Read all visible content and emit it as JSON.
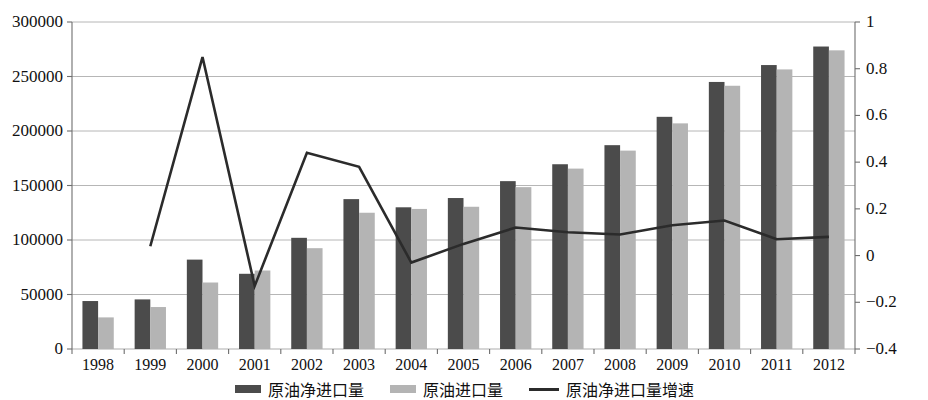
{
  "chart_data": {
    "type": "bar",
    "title": "",
    "subtitle": "",
    "xlabel": "",
    "ylabel": "",
    "y2label": "",
    "categories": [
      "1998",
      "1999",
      "2000",
      "2001",
      "2002",
      "2003",
      "2004",
      "2005",
      "2006",
      "2007",
      "2008",
      "2009",
      "2010",
      "2011",
      "2012"
    ],
    "ylim": [
      0,
      300000
    ],
    "y_ticks": [
      "0",
      "50000",
      "100000",
      "150000",
      "200000",
      "250000",
      "300000"
    ],
    "y_tick_values": [
      0,
      50000,
      100000,
      150000,
      200000,
      250000,
      300000
    ],
    "y2lim": [
      -0.4,
      1
    ],
    "y2_ticks": [
      "-0.4",
      "-0.2",
      "0",
      "0.2",
      "0.4",
      "0.6",
      "0.8",
      "1"
    ],
    "y2_tick_values": [
      -0.4,
      -0.2,
      0,
      0.2,
      0.4,
      0.6,
      0.8,
      1
    ],
    "grid": true,
    "legend_position": "bottom",
    "series": [
      {
        "name": "原油净进口量",
        "kind": "bar",
        "axis": "left",
        "color": "#4b4b4b",
        "values": [
          44000,
          45500,
          82000,
          69000,
          102000,
          137500,
          130000,
          138500,
          154000,
          169500,
          187000,
          213000,
          245000,
          260500,
          277500
        ]
      },
      {
        "name": "原油进口量",
        "kind": "bar",
        "axis": "left",
        "color": "#b4b4b4",
        "values": [
          29000,
          38500,
          61000,
          72000,
          92500,
          125000,
          128500,
          130500,
          148500,
          165500,
          182000,
          207000,
          241500,
          256500,
          274000
        ]
      },
      {
        "name": "原油净进口量增速",
        "kind": "line",
        "axis": "right",
        "color": "#2b2b2b",
        "values": [
          null,
          0.04,
          0.85,
          -0.13,
          0.44,
          0.38,
          -0.03,
          0.05,
          0.12,
          0.1,
          0.09,
          0.13,
          0.15,
          0.07,
          0.08
        ]
      }
    ]
  },
  "legend": {
    "items": [
      {
        "label": "原油净进口量",
        "swatch": "dark-bar-swatch",
        "color": "#4b4b4b",
        "type": "bar"
      },
      {
        "label": "原油进口量",
        "swatch": "light-bar-swatch",
        "color": "#b4b4b4",
        "type": "bar"
      },
      {
        "label": "原油净进口量增速",
        "swatch": "line-swatch",
        "color": "#2b2b2b",
        "type": "line"
      }
    ]
  },
  "colors": {
    "dark_bar": "#4b4b4b",
    "light_bar": "#b4b4b4",
    "line": "#2b2b2b",
    "grid": "#aeaeae",
    "axis": "#6e6e6e",
    "background": "#ffffff"
  }
}
